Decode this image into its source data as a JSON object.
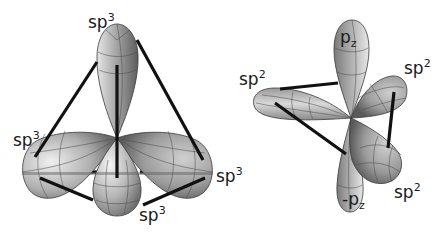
{
  "figures": [
    {
      "name": "sp3-tetrahedral",
      "center": [
        117,
        138
      ],
      "labels": [
        {
          "text": "sp",
          "sup": "3",
          "position": "top",
          "x": 88,
          "y": 28
        },
        {
          "text": "sp",
          "sup": "3",
          "position": "left",
          "x": 13,
          "y": 146
        },
        {
          "text": "sp",
          "sup": "3",
          "position": "right",
          "x": 216,
          "y": 182
        },
        {
          "text": "sp",
          "sup": "3",
          "position": "bottom",
          "x": 139,
          "y": 221
        }
      ]
    },
    {
      "name": "sp2-trigonal-planar",
      "center": [
        351,
        118
      ],
      "labels": [
        {
          "text": "p",
          "sub": "z",
          "position": "top-lobe",
          "x": 340,
          "y": 43
        },
        {
          "text": "sp",
          "sup": "2",
          "position": "left",
          "x": 239,
          "y": 85
        },
        {
          "text": "sp",
          "sup": "2",
          "position": "upper-right",
          "x": 404,
          "y": 74
        },
        {
          "text": "sp",
          "sup": "2",
          "position": "lower-right",
          "x": 394,
          "y": 198
        },
        {
          "text": "-p",
          "sub": "z",
          "position": "bottom-lobe",
          "x": 342,
          "y": 205
        }
      ]
    }
  ],
  "colors": {
    "background": "#ffffff",
    "lobe_light": "#f2f2f2",
    "lobe_mid": "#b8b8b8",
    "lobe_dark": "#6e6e6e",
    "edge": "#111111",
    "text": "#1a1a1a"
  }
}
